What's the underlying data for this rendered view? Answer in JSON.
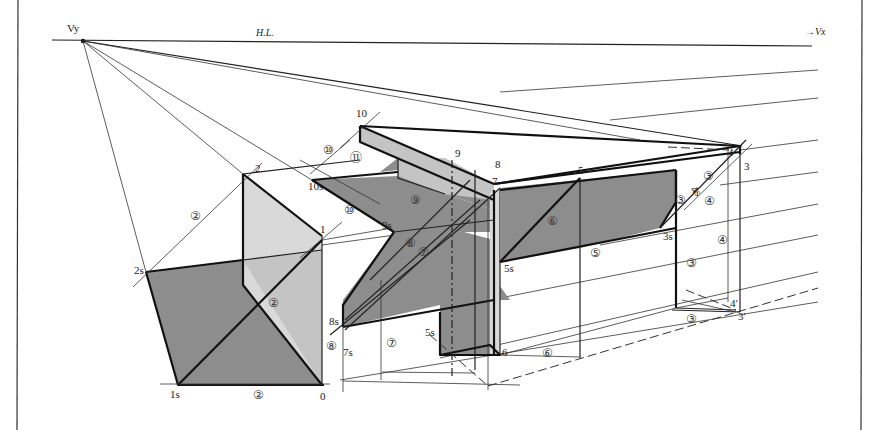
{
  "figure": {
    "type": "perspective shadow construction drawing",
    "horizon_label": "H.L.",
    "vanishing_points": {
      "left": "Vy",
      "right": "→Vx"
    },
    "colors": {
      "background": "#ffffff",
      "line": "#111111",
      "cast_shadow": "#8d8d8d",
      "shade_face": "#c4c4c4",
      "light_face": "#d9d9d9"
    }
  },
  "points": {
    "p0": "0",
    "p1": "1",
    "p2": "2",
    "p3": "3",
    "p4": "4",
    "p5": "5",
    "p6": "6",
    "p7": "7",
    "p8": "8",
    "p9": "9",
    "p10": "10",
    "p1s": "1s",
    "p2s": "2s",
    "p3s": "3s",
    "p5s_a": "5s",
    "p5s_b": "5s",
    "p7s": "7s",
    "p8s": "8s",
    "p9s": "9s",
    "p10s": "10s",
    "p3prime": "3′",
    "p4prime": "4′",
    "p4s": "4s"
  },
  "circled_steps": {
    "c2_bottom": "②",
    "c2_left": "②",
    "c2_mid": "②",
    "c3_a": "③",
    "c3_b": "③",
    "c3_c": "③",
    "c3_d": "③",
    "c4_a": "④",
    "c4_b": "④",
    "c5": "⑤",
    "c6_a": "⑥",
    "c6_b": "⑥",
    "c7_a": "⑦",
    "c7_b": "⑦",
    "c8_a": "⑧",
    "c8_b": "⑧",
    "c9": "⑨",
    "c10_a": "⑩",
    "c10_b": "⑩",
    "c11": "⑪"
  }
}
